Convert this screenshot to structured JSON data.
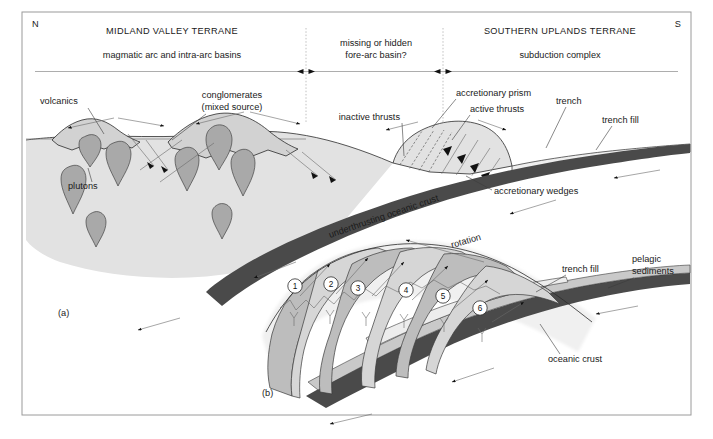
{
  "figure": {
    "orientation_left": "N",
    "orientation_right": "S",
    "panel_a_label": "(a)",
    "panel_b_label": "(b)"
  },
  "header": {
    "terranes": [
      {
        "name": "MIDLAND VALLEY TERRANE",
        "subtitle": "magmatic arc and intra-arc basins"
      },
      {
        "name": "",
        "subtitle": "missing or hidden\nfore-arc basin?"
      },
      {
        "name": "SOUTHERN UPLANDS TERRANE",
        "subtitle": "subduction complex"
      }
    ],
    "midland_name": "MIDLAND VALLEY TERRANE",
    "midland_sub": "magmatic arc and intra-arc basins",
    "gap_line1": "missing or hidden",
    "gap_line2": "fore-arc basin?",
    "southern_name": "SOUTHERN UPLANDS TERRANE",
    "southern_sub": "subduction complex"
  },
  "panel_a": {
    "labels": {
      "volcanics": "volcanics",
      "conglomerates_line1": "conglomerates",
      "conglomerates_line2": "(mixed source)",
      "plutons": "plutons",
      "inactive_thrusts": "inactive thrusts",
      "accretionary_prism": "accretionary prism",
      "active_thrusts": "active thrusts",
      "trench": "trench",
      "trench_fill": "trench fill",
      "accretionary_wedges": "accretionary wedges",
      "underthrusting": "underthrusting oceanic crust"
    }
  },
  "panel_b": {
    "labels": {
      "rotation": "rotation",
      "trench_fill": "trench fill",
      "pelagic_line1": "pelagic",
      "pelagic_line2": "sediments",
      "oceanic_crust": "oceanic crust"
    },
    "wedge_numbers": [
      "1",
      "2",
      "3",
      "4",
      "5",
      "6"
    ]
  },
  "colors": {
    "background": "#ffffff",
    "crust_light": "#e2e2e2",
    "pluton_gray": "#a9a9a9",
    "slab_dark": "#4a4a4a",
    "wedge_mid": "#b9b9b9",
    "wedge_light": "#dcdcdc",
    "sediment_gray": "#c9c9c9",
    "line": "#2b2b2b",
    "frame": "#9a9a9a"
  }
}
